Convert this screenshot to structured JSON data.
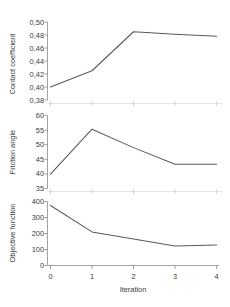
{
  "figure": {
    "xlabel": "Iteration",
    "panel_count": 3
  },
  "chart_data": [
    {
      "type": "line",
      "title": "",
      "xlabel": "Iteration",
      "ylabel": "Contact coefficient",
      "x": [
        0,
        1,
        2,
        3,
        4
      ],
      "values": [
        0.4,
        0.425,
        0.485,
        0.481,
        0.478
      ],
      "xlim": [
        0,
        4
      ],
      "ylim": [
        0.38,
        0.5
      ],
      "xticks": [
        0,
        1,
        2,
        3,
        4
      ],
      "yticks": [
        0.38,
        0.4,
        0.42,
        0.44,
        0.46,
        0.48,
        0.5
      ],
      "ytick_labels": [
        "0,38",
        "0,40",
        "0,42",
        "0,44",
        "0,46",
        "0,48",
        "0,50"
      ],
      "grid": false,
      "legend": "none",
      "line_color": "#59595b"
    },
    {
      "type": "line",
      "title": "",
      "xlabel": "Iteration",
      "ylabel": "Friction angle",
      "x": [
        0,
        1,
        2,
        3,
        4
      ],
      "values": [
        39.9,
        55.3,
        49.0,
        43.3,
        43.3
      ],
      "xlim": [
        0,
        4
      ],
      "ylim": [
        35,
        60
      ],
      "xticks": [
        0,
        1,
        2,
        3,
        4
      ],
      "yticks": [
        35,
        40,
        45,
        50,
        55,
        60
      ],
      "ytick_labels": [
        "35",
        "40",
        "45",
        "50",
        "55",
        "60"
      ],
      "grid": false,
      "legend": "none",
      "line_color": "#59595b"
    },
    {
      "type": "line",
      "title": "",
      "xlabel": "Iteration",
      "ylabel": "Objective function",
      "x": [
        0,
        1,
        2,
        3,
        4
      ],
      "values": [
        375,
        210,
        165,
        122,
        128
      ],
      "xlim": [
        0,
        4
      ],
      "ylim": [
        0,
        400
      ],
      "xticks": [
        0,
        1,
        2,
        3,
        4
      ],
      "xtick_labels": [
        "0",
        "1",
        "2",
        "3",
        "4"
      ],
      "yticks": [
        0,
        100,
        200,
        300,
        400
      ],
      "ytick_labels": [
        "0",
        "100",
        "200",
        "300",
        "400"
      ],
      "grid": false,
      "legend": "none",
      "line_color": "#59595b"
    }
  ],
  "panels": [
    {
      "ylabel": "Contact coefficient",
      "ytick_labels": [
        "0,50",
        "0,48",
        "0,46",
        "0,44",
        "0,42",
        "0,40",
        "0,38"
      ]
    },
    {
      "ylabel": "Friction angle",
      "ytick_labels": [
        "60",
        "55",
        "50",
        "45",
        "40",
        "35"
      ]
    },
    {
      "ylabel": "Objective function",
      "ytick_labels": [
        "400",
        "300",
        "200",
        "100",
        "0"
      ]
    }
  ],
  "xaxis": {
    "label": "Iteration",
    "tick_labels": [
      "0",
      "1",
      "2",
      "3",
      "4"
    ]
  }
}
